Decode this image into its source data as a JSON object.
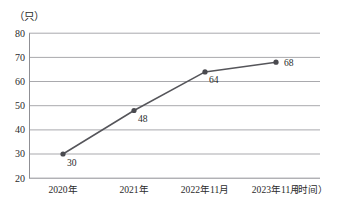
{
  "chart_data": {
    "type": "line",
    "title": "",
    "subtitle": "",
    "xlabel": "（时间）",
    "ylabel": "（只）",
    "categories": [
      "2020年",
      "2021年",
      "2022年11月",
      "2023年11月"
    ],
    "values": [
      30,
      48,
      64,
      68
    ],
    "point_labels": [
      "30",
      "48",
      "64",
      "68"
    ],
    "ylim": [
      20,
      80
    ],
    "yticks": [
      20,
      30,
      40,
      50,
      60,
      70,
      80
    ],
    "ytick_labels": [
      "20",
      "30",
      "40",
      "50",
      "60",
      "70",
      "80"
    ],
    "grid": true,
    "grid_axis": "y",
    "legend": false,
    "legend_position": "none",
    "series": [
      {
        "name": "数量",
        "values": [
          30,
          48,
          64,
          68
        ],
        "marker": "circle",
        "line_color": "#55555a",
        "marker_color": "#4a4a4f"
      }
    ],
    "colors": {
      "line": "#55555a",
      "marker": "#4a4a4f",
      "grid": "#a9a9ad",
      "axis": "#8f8f94",
      "text": "#2b2b2b",
      "background": "#ffffff"
    }
  },
  "axis": {
    "y_unit": "（只）",
    "x_unit": "（时间）"
  }
}
